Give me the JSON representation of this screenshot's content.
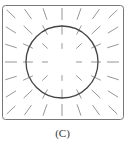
{
  "figure": {
    "caption": "(C)",
    "frame": {
      "x": 2.5,
      "y": 5.5,
      "width": 121,
      "height": 114,
      "rx": 3,
      "stroke": "#777777"
    },
    "circle": {
      "cx": 62,
      "cy": 62,
      "r": 36,
      "stroke": "#444444"
    },
    "field": {
      "type": "radial direction field",
      "center": [
        62,
        62
      ],
      "columns": [
        11,
        28,
        45,
        62,
        79,
        96,
        113
      ],
      "rows": [
        14,
        30,
        46,
        62,
        78,
        94,
        110
      ],
      "segment_color": "#8a8a8a",
      "max_half_length": 6,
      "scale_distance": 52
    }
  }
}
